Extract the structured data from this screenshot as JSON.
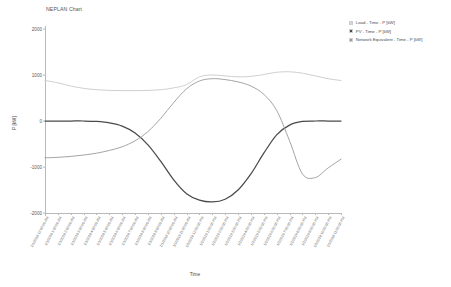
{
  "chart_title": "NEPLAN Chart",
  "legend": {
    "position": "top-right",
    "entries": [
      {
        "label": "Load - Time - P [kW]",
        "color": "#c9c9c9",
        "key": "load"
      },
      {
        "label": "PV - Time - P [kW]",
        "color": "#4a4a4a",
        "key": "network"
      },
      {
        "label": "Network Equivalent - Time - P [kW]",
        "color": "#9a9a9a",
        "key": "pv"
      }
    ]
  },
  "chart_data": {
    "type": "line",
    "title": "NEPLAN Chart",
    "xlabel": "Time",
    "ylabel": "P [kW]",
    "ylim": [
      -2000,
      2000
    ],
    "yticks": [
      2000,
      1000,
      0,
      -1000,
      -2000
    ],
    "ytick_labels": [
      "2000",
      "1000",
      "0",
      "-1000",
      "-2000"
    ],
    "grid": false,
    "legend_position": "top-right",
    "x": [
      "1/1/2019 12:00:00 AM",
      "1/1/2019 1:00:00 AM",
      "1/1/2019 2:00:00 AM",
      "1/1/2019 3:00:00 AM",
      "1/1/2019 4:00:00 AM",
      "1/1/2019 5:00:00 AM",
      "1/1/2019 6:00:00 AM",
      "1/1/2019 7:00:00 AM",
      "1/1/2019 8:00:00 AM",
      "1/1/2019 9:00:00 AM",
      "1/1/2019 10:00:00 AM",
      "1/1/2019 11:00:00 AM",
      "1/1/2019 12:00:00 PM",
      "1/1/2019 1:00:00 PM",
      "1/1/2019 2:00:00 PM",
      "1/1/2019 3:00:00 PM",
      "1/1/2019 4:00:00 PM",
      "1/1/2019 5:00:00 PM",
      "1/1/2019 6:00:00 PM",
      "1/1/2019 7:00:00 PM",
      "1/1/2019 8:00:00 PM",
      "1/1/2019 9:00:00 PM",
      "1/1/2019 10:00:00 PM",
      "1/1/2019 11:00:00 PM"
    ],
    "series": [
      {
        "name": "Load - Time - P [kW]",
        "color": "#c9c9c9",
        "values": [
          880,
          830,
          760,
          710,
          680,
          665,
          660,
          660,
          665,
          680,
          720,
          790,
          960,
          1000,
          980,
          960,
          970,
          1010,
          1060,
          1070,
          1040,
          980,
          920,
          880
        ]
      },
      {
        "name": "PV - Time - P [kW]",
        "color": "#4a4a4a",
        "values": [
          0,
          0,
          0,
          0,
          -10,
          -40,
          -110,
          -260,
          -520,
          -880,
          -1280,
          -1580,
          -1720,
          -1760,
          -1700,
          -1500,
          -1150,
          -700,
          -300,
          -90,
          -10,
          0,
          0,
          0
        ]
      },
      {
        "name": "Network Equivalent - Time - P [kW]",
        "color": "#9a9a9a",
        "values": [
          -800,
          -790,
          -770,
          -740,
          -700,
          -640,
          -560,
          -430,
          -230,
          60,
          400,
          700,
          870,
          920,
          900,
          850,
          760,
          580,
          230,
          -430,
          -1150,
          -1230,
          -1020,
          -830
        ]
      }
    ]
  }
}
